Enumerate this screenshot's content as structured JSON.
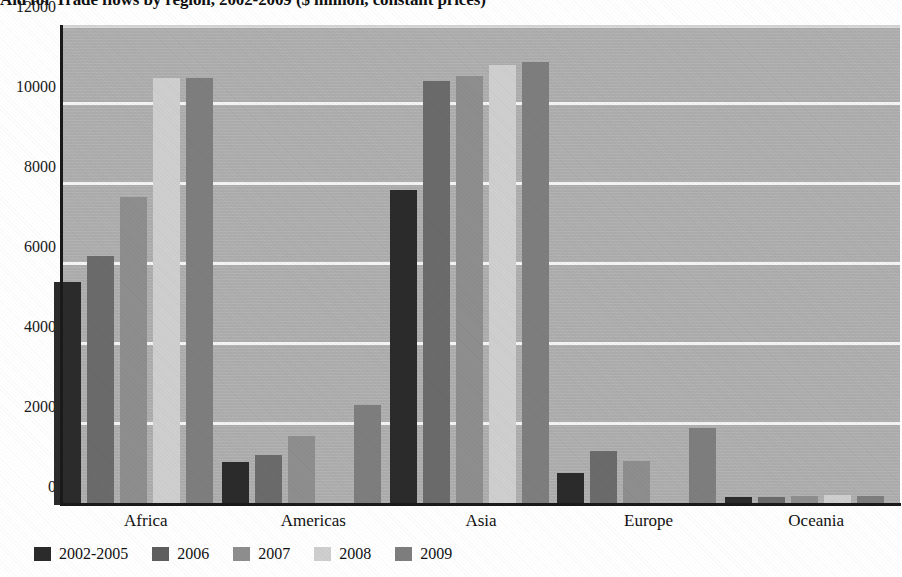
{
  "title": "Aid for Trade flows by region, 2002-2009 ($ million, constant prices)",
  "chart_data": {
    "type": "bar",
    "title": "Aid for Trade flows by region, 2002-2009 ($ million, constant prices)",
    "xlabel": "",
    "ylabel": "",
    "ylim": [
      0,
      12000
    ],
    "yticks": [
      0,
      2000,
      4000,
      6000,
      8000,
      10000,
      12000
    ],
    "ytick_labels": [
      "0",
      "2000",
      "4000",
      "6000",
      "8000",
      "10000",
      "12000"
    ],
    "grid": true,
    "legend_position": "bottom-left",
    "categories": [
      "Africa",
      "Americas",
      "Asia",
      "Europe",
      "Oceania"
    ],
    "series": [
      {
        "name": "2002-2005",
        "color": "#2b2b2b",
        "values": [
          5570,
          1080,
          7880,
          800,
          210
        ]
      },
      {
        "name": "2006",
        "color": "#6b6b6b",
        "values": [
          6220,
          1250,
          10610,
          1340,
          190
        ]
      },
      {
        "name": "2007",
        "color": "#8e8e8e",
        "values": [
          7700,
          1720,
          10730,
          1100,
          220
        ]
      },
      {
        "name": "2008",
        "color": "#cfcfcf",
        "values": [
          10680,
          0,
          11000,
          0,
          250
        ]
      },
      {
        "name": "2009",
        "color": "#7e7e7e",
        "values": [
          10680,
          2490,
          11080,
          1930,
          230
        ]
      }
    ]
  },
  "axis": {
    "y_tick_labels": [
      "12000",
      "10000",
      "8000",
      "6000",
      "4000",
      "2000",
      "0"
    ]
  },
  "legend": {
    "items": [
      {
        "label": "2002-2005",
        "color": "#2b2b2b"
      },
      {
        "label": "2006",
        "color": "#5e5e5e"
      },
      {
        "label": "2007",
        "color": "#8e8e8e"
      },
      {
        "label": "2008",
        "color": "#cfcfcf"
      },
      {
        "label": "2009",
        "color": "#7e7e7e"
      }
    ]
  },
  "colors": {
    "plot_background": "#b2b2b2",
    "gridline": "#f4f4f4",
    "axis": "#1a1a1a",
    "page_background": "#ffffff"
  }
}
